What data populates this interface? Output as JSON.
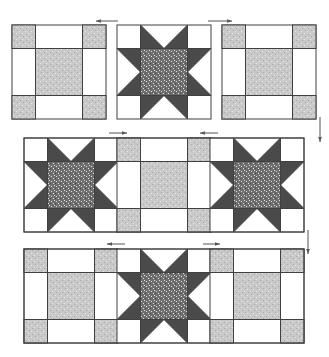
{
  "colors": {
    "outline": "#404040",
    "background": "#ffffff",
    "light_fabric": "#c9c9c9",
    "light_speck": "#e6e6e6",
    "star_center": "#6e6e6e",
    "star_speck": "#e0e0e0",
    "star_points": "#4a4a4a",
    "arrow": "#555555"
  },
  "rows": [
    {
      "blocks": [
        "nine-patch",
        "star",
        "nine-patch"
      ],
      "arrows": [
        "left",
        "right"
      ]
    },
    {
      "blocks": [
        "star",
        "nine-patch",
        "star"
      ],
      "arrows": [
        "right",
        "left"
      ]
    },
    {
      "blocks": [
        "nine-patch",
        "star",
        "nine-patch"
      ],
      "arrows": [
        "left",
        "right"
      ]
    }
  ],
  "side_arrows": [
    "down",
    "down"
  ]
}
